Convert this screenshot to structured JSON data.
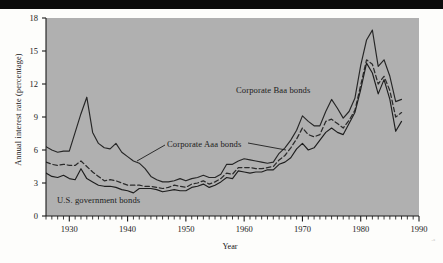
{
  "figure": {
    "kind": "line-chart",
    "background_color": "#b0b0b0",
    "page_color": "#fdfdfb",
    "top_band_color": "#0b0b0b"
  },
  "axis": {
    "y_title": "Annual interest rate (percentage)",
    "x_title": "Year",
    "y_ticks": [
      "0",
      "3",
      "6",
      "9",
      "12",
      "15",
      "18"
    ],
    "x_ticks": [
      "1930",
      "1940",
      "1950",
      "1960",
      "1970",
      "1980",
      "1990"
    ]
  },
  "labels": {
    "baa": "Corporate Baa bonds",
    "aaa": "Corporate Aaa bonds",
    "gov": "U.S. government bonds"
  },
  "chart_data": {
    "type": "line",
    "title": "",
    "xlabel": "Year",
    "ylabel": "Annual interest rate (percentage)",
    "xlim": [
      1926,
      1990
    ],
    "ylim": [
      0,
      18
    ],
    "yticks": [
      0,
      3,
      6,
      9,
      12,
      15,
      18
    ],
    "xticks": [
      1930,
      1940,
      1950,
      1960,
      1970,
      1980,
      1990
    ],
    "minor_xtick_interval": 1,
    "grid": false,
    "legend": "inline-annotations",
    "x": [
      1926,
      1927,
      1928,
      1929,
      1930,
      1931,
      1932,
      1933,
      1934,
      1935,
      1936,
      1937,
      1938,
      1939,
      1940,
      1941,
      1942,
      1943,
      1944,
      1945,
      1946,
      1947,
      1948,
      1949,
      1950,
      1951,
      1952,
      1953,
      1954,
      1955,
      1956,
      1957,
      1958,
      1959,
      1960,
      1961,
      1962,
      1963,
      1964,
      1965,
      1966,
      1967,
      1968,
      1969,
      1970,
      1971,
      1972,
      1973,
      1974,
      1975,
      1976,
      1977,
      1978,
      1979,
      1980,
      1981,
      1982,
      1983,
      1984,
      1985,
      1986,
      1987
    ],
    "series": [
      {
        "name": "Corporate Baa bonds",
        "style": "solid",
        "color": "#262626",
        "values": [
          6.3,
          6.0,
          5.8,
          5.9,
          5.9,
          7.6,
          9.3,
          10.8,
          7.6,
          6.6,
          6.2,
          6.1,
          6.6,
          5.8,
          5.4,
          5.0,
          4.8,
          4.3,
          3.6,
          3.3,
          3.1,
          3.1,
          3.2,
          3.4,
          3.2,
          3.4,
          3.5,
          3.7,
          3.5,
          3.5,
          3.8,
          4.7,
          4.7,
          5.0,
          5.2,
          5.1,
          5.0,
          4.9,
          4.8,
          4.9,
          5.7,
          6.2,
          6.9,
          7.8,
          9.1,
          8.6,
          8.2,
          8.2,
          9.5,
          10.6,
          9.8,
          8.9,
          9.5,
          10.7,
          13.7,
          16.0,
          16.9,
          13.6,
          14.2,
          12.7,
          10.4,
          10.6
        ]
      },
      {
        "name": "Corporate Aaa bonds",
        "style": "dashed",
        "color": "#2b2b2b",
        "values": [
          4.9,
          4.7,
          4.6,
          4.7,
          4.6,
          4.6,
          5.0,
          4.5,
          4.0,
          3.6,
          3.2,
          3.3,
          3.2,
          3.0,
          2.8,
          2.8,
          2.8,
          2.7,
          2.7,
          2.6,
          2.5,
          2.6,
          2.8,
          2.7,
          2.6,
          2.9,
          3.0,
          3.2,
          2.9,
          3.1,
          3.4,
          3.9,
          3.8,
          4.4,
          4.4,
          4.4,
          4.3,
          4.3,
          4.4,
          4.5,
          5.1,
          5.5,
          6.2,
          7.0,
          8.0,
          7.4,
          7.2,
          7.4,
          8.6,
          8.8,
          8.4,
          8.0,
          8.7,
          9.6,
          11.9,
          14.2,
          13.8,
          12.0,
          12.7,
          11.4,
          9.0,
          9.4
        ]
      },
      {
        "name": "U.S. government bonds",
        "style": "solid",
        "color": "#1e1e1e",
        "values": [
          3.9,
          3.6,
          3.5,
          3.7,
          3.4,
          3.3,
          4.3,
          3.4,
          3.1,
          2.8,
          2.7,
          2.7,
          2.6,
          2.4,
          2.3,
          2.1,
          2.5,
          2.5,
          2.5,
          2.4,
          2.2,
          2.3,
          2.4,
          2.3,
          2.3,
          2.6,
          2.7,
          2.9,
          2.6,
          2.8,
          3.1,
          3.5,
          3.4,
          4.1,
          4.0,
          3.9,
          4.0,
          4.0,
          4.2,
          4.2,
          4.7,
          4.9,
          5.3,
          6.1,
          6.6,
          6.0,
          6.2,
          6.9,
          7.6,
          8.0,
          7.6,
          7.4,
          8.4,
          9.4,
          11.5,
          13.9,
          13.0,
          11.1,
          12.4,
          10.6,
          7.7,
          8.6
        ]
      }
    ]
  }
}
